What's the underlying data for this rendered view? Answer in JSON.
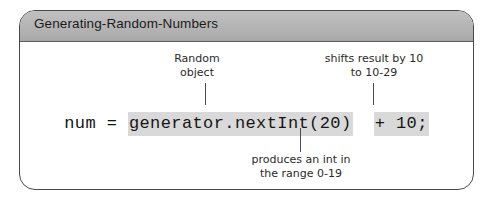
{
  "figure": {
    "title": "Generating-Random-Numbers",
    "code": {
      "prefix": "num = ",
      "segment_1": "generator.nextInt(20)",
      "gap_1": "  ",
      "segment_2": "+ 10;"
    },
    "annotations": {
      "random_object": "Random\nobject",
      "shifts_result": "shifts result by 10\nto 10-29",
      "produces_int": "produces an int in\nthe range 0-19"
    },
    "colors": {
      "title_band": "#b6b6b6",
      "panel_border": "#4a4a4a",
      "code_highlight": "#d9d9d9",
      "leader_line": "#4d4d4d",
      "text": "#151515"
    }
  }
}
